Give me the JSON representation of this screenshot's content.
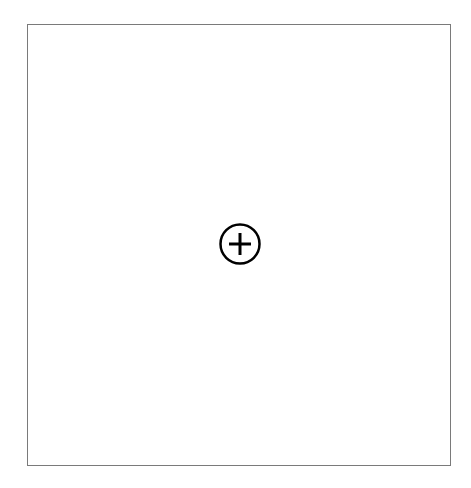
{
  "canvas": {
    "border_color": "#7a7a7a",
    "background": "#ffffff"
  },
  "add_button": {
    "icon": "plus-circle-icon",
    "label": "Add",
    "color": "#000000"
  }
}
